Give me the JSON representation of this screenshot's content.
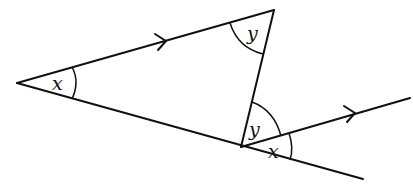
{
  "diagram": {
    "type": "geometry-angles-parallel-lines",
    "colors": {
      "stroke": "#111111",
      "background": "#ffffff"
    },
    "points": {
      "A": [
        17,
        83
      ],
      "B": [
        274,
        10
      ],
      "C": [
        241,
        147
      ],
      "bottom_end": [
        363,
        179
      ],
      "ray_end": [
        410,
        98
      ]
    },
    "labels": {
      "angle_A": "x",
      "angle_B": "y",
      "angle_C_upper": "y",
      "angle_C_lower": "x"
    },
    "parallel_marks": [
      "arrow on line AB",
      "arrow on ray from C"
    ]
  }
}
